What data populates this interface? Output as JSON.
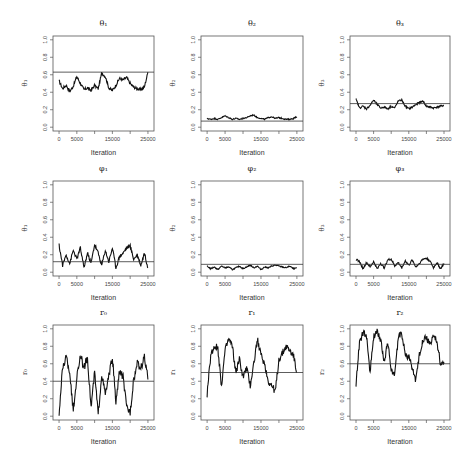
{
  "figure": {
    "layout": {
      "rows": 3,
      "cols": 3
    }
  },
  "chart_data": [
    {
      "type": "line",
      "title": "θ₁",
      "xlabel": "Iteration",
      "ylabel": "θ₁",
      "xlim": [
        0,
        25000
      ],
      "ylim": [
        0,
        1
      ],
      "xticks": [
        0,
        5000,
        10000,
        15000,
        20000,
        25000
      ],
      "xtick_labels": [
        "0",
        "5000",
        "",
        "15000",
        "",
        "25000"
      ],
      "yticks": [
        0.0,
        0.2,
        0.4,
        0.6,
        0.8,
        1.0
      ],
      "ytick_labels": [
        "0.0",
        "0.2",
        "0.4",
        "0.6",
        "0.8",
        "1.0"
      ],
      "reference_line": 0.63,
      "x": [
        0,
        1000,
        2000,
        3000,
        4000,
        5000,
        6000,
        7000,
        8000,
        9000,
        10000,
        11000,
        12000,
        13000,
        14000,
        15000,
        16000,
        17000,
        18000,
        19000,
        20000,
        21000,
        22000,
        23000,
        24000,
        25000
      ],
      "values": [
        0.53,
        0.44,
        0.48,
        0.41,
        0.47,
        0.58,
        0.5,
        0.43,
        0.45,
        0.42,
        0.48,
        0.44,
        0.62,
        0.58,
        0.45,
        0.42,
        0.48,
        0.56,
        0.54,
        0.57,
        0.5,
        0.46,
        0.44,
        0.43,
        0.46,
        0.63
      ]
    },
    {
      "type": "line",
      "title": "θ₂",
      "xlabel": "Iteration",
      "ylabel": "θ₂",
      "xlim": [
        0,
        25000
      ],
      "ylim": [
        0,
        1
      ],
      "xticks": [
        0,
        5000,
        10000,
        15000,
        20000,
        25000
      ],
      "xtick_labels": [
        "0",
        "5000",
        "",
        "15000",
        "",
        "25000"
      ],
      "yticks": [
        0.0,
        0.2,
        0.4,
        0.6,
        0.8,
        1.0
      ],
      "ytick_labels": [
        "0.0",
        "0.2",
        "0.4",
        "0.6",
        "0.8",
        "1.0"
      ],
      "reference_line": 0.07,
      "x": [
        0,
        1000,
        2000,
        3000,
        4000,
        5000,
        6000,
        7000,
        8000,
        9000,
        10000,
        11000,
        12000,
        13000,
        14000,
        15000,
        16000,
        17000,
        18000,
        19000,
        20000,
        21000,
        22000,
        23000,
        24000,
        25000
      ],
      "values": [
        0.1,
        0.09,
        0.1,
        0.09,
        0.11,
        0.13,
        0.11,
        0.09,
        0.1,
        0.09,
        0.1,
        0.11,
        0.13,
        0.14,
        0.11,
        0.1,
        0.09,
        0.11,
        0.12,
        0.1,
        0.11,
        0.1,
        0.09,
        0.09,
        0.1,
        0.12
      ]
    },
    {
      "type": "line",
      "title": "θ₃",
      "xlabel": "Iteration",
      "ylabel": "θ₃",
      "xlim": [
        0,
        25000
      ],
      "ylim": [
        0,
        1
      ],
      "xticks": [
        0,
        5000,
        10000,
        15000,
        20000,
        25000
      ],
      "xtick_labels": [
        "0",
        "5000",
        "",
        "15000",
        "",
        "25000"
      ],
      "yticks": [
        0.0,
        0.2,
        0.4,
        0.6,
        0.8,
        1.0
      ],
      "ytick_labels": [
        "0.0",
        "0.2",
        "0.4",
        "0.6",
        "0.8",
        "1.0"
      ],
      "reference_line": 0.27,
      "x": [
        0,
        1000,
        2000,
        3000,
        4000,
        5000,
        6000,
        7000,
        8000,
        9000,
        10000,
        11000,
        12000,
        13000,
        14000,
        15000,
        16000,
        17000,
        18000,
        19000,
        20000,
        21000,
        22000,
        23000,
        24000,
        25000
      ],
      "values": [
        0.32,
        0.22,
        0.24,
        0.21,
        0.25,
        0.31,
        0.26,
        0.22,
        0.23,
        0.21,
        0.24,
        0.22,
        0.3,
        0.31,
        0.24,
        0.21,
        0.23,
        0.26,
        0.28,
        0.3,
        0.24,
        0.23,
        0.22,
        0.23,
        0.24,
        0.25
      ]
    },
    {
      "type": "line",
      "title": "φ₁",
      "xlabel": "Iteration",
      "ylabel": "θ₁",
      "xlim": [
        0,
        25000
      ],
      "ylim": [
        0,
        1
      ],
      "xticks": [
        0,
        5000,
        10000,
        15000,
        20000,
        25000
      ],
      "xtick_labels": [
        "0",
        "5000",
        "",
        "15000",
        "",
        "25000"
      ],
      "yticks": [
        0.0,
        0.2,
        0.4,
        0.6,
        0.8,
        1.0
      ],
      "ytick_labels": [
        "0.0",
        "0.2",
        "0.4",
        "0.6",
        "0.8",
        "1.0"
      ],
      "reference_line": 0.12,
      "x": [
        0,
        1000,
        2000,
        3000,
        4000,
        5000,
        6000,
        7000,
        8000,
        9000,
        10000,
        11000,
        12000,
        13000,
        14000,
        15000,
        16000,
        17000,
        18000,
        19000,
        20000,
        21000,
        22000,
        23000,
        24000,
        25000
      ],
      "values": [
        0.31,
        0.08,
        0.2,
        0.1,
        0.25,
        0.15,
        0.28,
        0.05,
        0.22,
        0.1,
        0.32,
        0.22,
        0.08,
        0.25,
        0.12,
        0.28,
        0.05,
        0.18,
        0.22,
        0.28,
        0.3,
        0.15,
        0.2,
        0.08,
        0.22,
        0.05
      ]
    },
    {
      "type": "line",
      "title": "φ₂",
      "xlabel": "Iteration",
      "ylabel": "θ₂",
      "xlim": [
        0,
        25000
      ],
      "ylim": [
        0,
        1
      ],
      "xticks": [
        0,
        5000,
        10000,
        15000,
        20000,
        25000
      ],
      "xtick_labels": [
        "0",
        "5000",
        "",
        "15000",
        "",
        "25000"
      ],
      "yticks": [
        0.0,
        0.2,
        0.4,
        0.6,
        0.8,
        1.0
      ],
      "ytick_labels": [
        "0.0",
        "0.2",
        "0.4",
        "0.6",
        "0.8",
        "1.0"
      ],
      "reference_line": 0.09,
      "x": [
        0,
        1000,
        2000,
        3000,
        4000,
        5000,
        6000,
        7000,
        8000,
        9000,
        10000,
        11000,
        12000,
        13000,
        14000,
        15000,
        16000,
        17000,
        18000,
        19000,
        20000,
        21000,
        22000,
        23000,
        24000,
        25000
      ],
      "values": [
        0.07,
        0.04,
        0.06,
        0.03,
        0.07,
        0.05,
        0.06,
        0.03,
        0.05,
        0.07,
        0.04,
        0.06,
        0.08,
        0.05,
        0.07,
        0.03,
        0.06,
        0.05,
        0.07,
        0.08,
        0.07,
        0.06,
        0.05,
        0.07,
        0.04,
        0.05
      ]
    },
    {
      "type": "line",
      "title": "φ₃",
      "xlabel": "Iteration",
      "ylabel": "θ₃",
      "xlim": [
        0,
        25000
      ],
      "ylim": [
        0,
        1
      ],
      "xticks": [
        0,
        5000,
        10000,
        15000,
        20000,
        25000
      ],
      "xtick_labels": [
        "0",
        "5000",
        "",
        "15000",
        "",
        "25000"
      ],
      "yticks": [
        0.0,
        0.2,
        0.4,
        0.6,
        0.8,
        1.0
      ],
      "ytick_labels": [
        "0.0",
        "0.2",
        "0.4",
        "0.6",
        "0.8",
        "1.0"
      ],
      "reference_line": 0.09,
      "x": [
        0,
        1000,
        2000,
        3000,
        4000,
        5000,
        6000,
        7000,
        8000,
        9000,
        10000,
        11000,
        12000,
        13000,
        14000,
        15000,
        16000,
        17000,
        18000,
        19000,
        20000,
        21000,
        22000,
        23000,
        24000,
        25000
      ],
      "values": [
        0.15,
        0.12,
        0.04,
        0.11,
        0.06,
        0.12,
        0.04,
        0.1,
        0.05,
        0.14,
        0.15,
        0.07,
        0.11,
        0.05,
        0.13,
        0.08,
        0.14,
        0.06,
        0.1,
        0.15,
        0.16,
        0.13,
        0.05,
        0.11,
        0.04,
        0.1
      ]
    },
    {
      "type": "line",
      "title": "r₀",
      "xlabel": "Iteration",
      "ylabel": "r₀",
      "xlim": [
        0,
        25000
      ],
      "ylim": [
        0,
        1
      ],
      "xticks": [
        0,
        5000,
        10000,
        15000,
        20000,
        25000
      ],
      "xtick_labels": [
        "0",
        "5000",
        "",
        "15000",
        "",
        "25000"
      ],
      "yticks": [
        0.0,
        0.2,
        0.4,
        0.6,
        0.8,
        1.0
      ],
      "ytick_labels": [
        "0.0",
        "0.2",
        "0.4",
        "0.6",
        "0.8",
        "1.0"
      ],
      "reference_line": 0.4,
      "x": [
        0,
        1000,
        2000,
        3000,
        4000,
        5000,
        6000,
        7000,
        8000,
        9000,
        10000,
        11000,
        12000,
        13000,
        14000,
        15000,
        16000,
        17000,
        18000,
        19000,
        20000,
        21000,
        22000,
        23000,
        24000,
        25000
      ],
      "values": [
        0.02,
        0.55,
        0.68,
        0.5,
        0.05,
        0.45,
        0.7,
        0.55,
        0.68,
        0.1,
        0.5,
        0.02,
        0.48,
        0.25,
        0.45,
        0.68,
        0.15,
        0.52,
        0.45,
        0.1,
        0.05,
        0.42,
        0.6,
        0.55,
        0.68,
        0.42
      ]
    },
    {
      "type": "line",
      "title": "r₁",
      "xlabel": "Iteration",
      "ylabel": "r₁",
      "xlim": [
        0,
        25000
      ],
      "ylim": [
        0,
        1
      ],
      "xticks": [
        0,
        5000,
        10000,
        15000,
        20000,
        25000
      ],
      "xtick_labels": [
        "0",
        "5000",
        "",
        "15000",
        "",
        "25000"
      ],
      "yticks": [
        0.0,
        0.2,
        0.4,
        0.6,
        0.8,
        1.0
      ],
      "ytick_labels": [
        "0.0",
        "0.2",
        "0.4",
        "0.6",
        "0.8",
        "1.0"
      ],
      "reference_line": 0.5,
      "x": [
        0,
        1000,
        2000,
        3000,
        4000,
        5000,
        6000,
        7000,
        8000,
        9000,
        10000,
        11000,
        12000,
        13000,
        14000,
        15000,
        16000,
        17000,
        18000,
        19000,
        20000,
        21000,
        22000,
        23000,
        24000,
        25000
      ],
      "values": [
        0.25,
        0.7,
        0.8,
        0.78,
        0.35,
        0.75,
        0.88,
        0.8,
        0.5,
        0.65,
        0.45,
        0.55,
        0.35,
        0.6,
        0.88,
        0.7,
        0.6,
        0.4,
        0.35,
        0.28,
        0.65,
        0.72,
        0.8,
        0.75,
        0.7,
        0.5
      ]
    },
    {
      "type": "line",
      "title": "r₂",
      "xlabel": "Iteration",
      "ylabel": "r₂",
      "xlim": [
        0,
        25000
      ],
      "ylim": [
        0,
        1
      ],
      "xticks": [
        0,
        5000,
        10000,
        15000,
        20000,
        25000
      ],
      "xtick_labels": [
        "0",
        "5000",
        "",
        "15000",
        "",
        "25000"
      ],
      "yticks": [
        0.0,
        0.2,
        0.4,
        0.6,
        0.8,
        1.0
      ],
      "ytick_labels": [
        "0.0",
        "0.2",
        "0.4",
        "0.6",
        "0.8",
        "1.0"
      ],
      "reference_line": 0.6,
      "x": [
        0,
        1000,
        2000,
        3000,
        4000,
        5000,
        6000,
        7000,
        8000,
        9000,
        10000,
        11000,
        12000,
        13000,
        14000,
        15000,
        16000,
        17000,
        18000,
        19000,
        20000,
        21000,
        22000,
        23000,
        24000,
        25000
      ],
      "values": [
        0.37,
        0.85,
        0.95,
        0.92,
        0.5,
        0.9,
        0.98,
        0.88,
        0.62,
        0.85,
        0.55,
        0.45,
        0.92,
        0.95,
        0.7,
        0.68,
        0.55,
        0.4,
        0.7,
        0.88,
        0.9,
        0.82,
        0.92,
        0.85,
        0.6,
        0.6
      ]
    }
  ]
}
